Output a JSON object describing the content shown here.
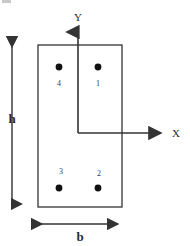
{
  "figure": {
    "title_visible": false,
    "background_color": "#ffffff",
    "line_color": "#333333",
    "text_color": "#2b2b2b"
  },
  "axes": {
    "y_label": "Y",
    "x_label": "X",
    "origin": {
      "x": 78,
      "y": 133
    },
    "y_axis": {
      "from_y": 133,
      "to_y": 28,
      "x": 78
    },
    "x_axis": {
      "from_x": 78,
      "to_x": 165,
      "y": 133
    }
  },
  "section": {
    "shape": "rectangle",
    "left": 38,
    "top": 45,
    "right": 122,
    "bottom": 207,
    "width_px": 84,
    "height_px": 162
  },
  "dimensions": {
    "height": {
      "label": "h",
      "orientation": "vertical",
      "x": 12,
      "from_y": 43,
      "to_y": 208,
      "label_y": 118
    },
    "width": {
      "label": "b",
      "orientation": "horizontal",
      "y": 224,
      "from_x": 38,
      "to_x": 122,
      "label_x": 80,
      "label_y": 236
    }
  },
  "bars": [
    {
      "id": "1",
      "label": "1",
      "dot_x": 98,
      "dot_y": 67,
      "label_x": 98,
      "label_y": 84,
      "quadrant": "upper-right"
    },
    {
      "id": "2",
      "label": "2",
      "dot_x": 98,
      "dot_y": 188,
      "label_x": 99,
      "label_y": 174,
      "quadrant": "lower-right"
    },
    {
      "id": "3",
      "label": "3",
      "dot_x": 59,
      "dot_y": 188,
      "label_x": 61,
      "label_y": 172,
      "quadrant": "lower-left"
    },
    {
      "id": "4",
      "label": "4",
      "dot_x": 59,
      "dot_y": 67,
      "label_x": 59,
      "label_y": 84,
      "quadrant": "upper-left"
    }
  ],
  "dot_radius": 3.4
}
